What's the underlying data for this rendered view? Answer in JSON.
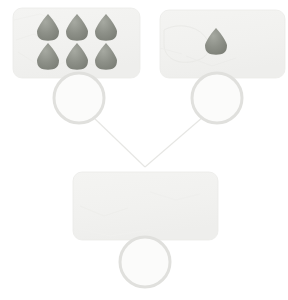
{
  "canvas": {
    "width": 288,
    "height": 300,
    "background": "#ffffff"
  },
  "palette": {
    "panel_fill": "#f2f2f0",
    "panel_fill_alt": "#f1f2f0",
    "panel_stroke": "#ebebe8",
    "egg_fill": "#8a8d85",
    "egg_fill_light": "#9a9d95",
    "egg_shadow": "#7d8078",
    "egg_highlight": "#a3a69e",
    "ring_stroke": "#e0e0dd",
    "ring_inner": "#fbfbfa",
    "connector_stroke": "#e6e6e3",
    "texture_stroke": "#ededea"
  },
  "panels": [
    {
      "id": "panel-top-left",
      "name": "egg-tray-six",
      "x": 13,
      "y": 8,
      "width": 127,
      "height": 70,
      "radius": 9,
      "egg_count": 6,
      "egg_layout": "3x2",
      "eggs": [
        {
          "cx": 48,
          "cy": 27,
          "rx": 11,
          "ry": 13
        },
        {
          "cx": 77,
          "cy": 27,
          "rx": 11,
          "ry": 13
        },
        {
          "cx": 106,
          "cy": 27,
          "rx": 11,
          "ry": 13
        },
        {
          "cx": 48,
          "cy": 56,
          "rx": 11,
          "ry": 13
        },
        {
          "cx": 77,
          "cy": 56,
          "rx": 11,
          "ry": 13
        },
        {
          "cx": 106,
          "cy": 56,
          "rx": 11,
          "ry": 13
        }
      ]
    },
    {
      "id": "panel-top-right",
      "name": "egg-tray-one",
      "x": 160,
      "y": 10,
      "width": 125,
      "height": 68,
      "radius": 9,
      "egg_count": 1,
      "egg_layout": "1x1",
      "eggs": [
        {
          "cx": 216,
          "cy": 41,
          "rx": 11,
          "ry": 13
        }
      ]
    },
    {
      "id": "panel-bottom",
      "name": "egg-tray-empty",
      "x": 73,
      "y": 172,
      "width": 145,
      "height": 68,
      "radius": 9,
      "egg_count": 0,
      "egg_layout": "none",
      "eggs": []
    }
  ],
  "rings": [
    {
      "id": "ring-top-left",
      "name": "selection-ring-left",
      "cx": 79,
      "cy": 98,
      "r": 25,
      "stroke_width": 3
    },
    {
      "id": "ring-top-right",
      "name": "selection-ring-right",
      "cx": 217,
      "cy": 98,
      "r": 25,
      "stroke_width": 3
    },
    {
      "id": "ring-bottom",
      "name": "selection-ring-bottom",
      "cx": 145,
      "cy": 262,
      "r": 25,
      "stroke_width": 3
    }
  ],
  "connectors": [
    {
      "id": "connector-left",
      "name": "connector-left-branch",
      "x1": 93,
      "y1": 117,
      "x2": 145,
      "y2": 167
    },
    {
      "id": "connector-right",
      "name": "connector-right-branch",
      "x1": 203,
      "y1": 117,
      "x2": 145,
      "y2": 167
    }
  ],
  "vertex": {
    "x": 145,
    "y": 167
  },
  "texture_marks": [
    {
      "id": "tex-a",
      "panel": "panel-top-left",
      "d": "M 18 52 L 46 70 L 74 58 L 96 66"
    },
    {
      "id": "tex-b",
      "panel": "panel-top-left",
      "d": "M 16 40 L 34 34 L 52 44"
    },
    {
      "id": "tex-c",
      "panel": "panel-top-right",
      "d": "M 164 30 C 178 22, 198 26, 206 38 C 214 50, 206 60, 190 62 C 174 64, 164 56, 164 44 Z"
    },
    {
      "id": "tex-d",
      "panel": "panel-top-right",
      "d": "M 186 56 L 212 66 L 236 58"
    },
    {
      "id": "tex-e",
      "panel": "panel-bottom",
      "d": "M 80 206 L 104 216 L 128 208"
    },
    {
      "id": "tex-f",
      "panel": "panel-bottom",
      "d": "M 150 192 L 176 200 L 200 194"
    }
  ],
  "accessibility": {
    "diagram_title": "Egg tray comparison diagram",
    "description": "Two source egg trays connect downward to one empty egg tray; each tray carries a circular marker."
  }
}
